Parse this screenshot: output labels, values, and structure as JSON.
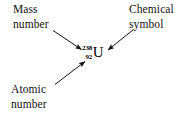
{
  "figure": {
    "type": "annotated-diagram",
    "background_color": "#ffffff",
    "ink_color": "#000000"
  },
  "nuclide": {
    "mass_number": "238",
    "atomic_number": "92",
    "element_symbol": "U"
  },
  "labels": {
    "mass_number": {
      "line1": "Mass",
      "line2": "number"
    },
    "chemical_symbol": {
      "line1": "Chemical",
      "line2": "symbol"
    },
    "atomic_number": {
      "line1": "Atomic",
      "line2": "number"
    }
  },
  "arrows": [
    {
      "name": "arrow-mass-number",
      "from_label": "Mass number",
      "to_target": "238",
      "direction": "down-right"
    },
    {
      "name": "arrow-chemical-symbol",
      "from_label": "Chemical symbol",
      "to_target": "U",
      "direction": "down-left"
    },
    {
      "name": "arrow-atomic-number",
      "from_label": "Atomic number",
      "to_target": "92",
      "direction": "up-right"
    }
  ]
}
